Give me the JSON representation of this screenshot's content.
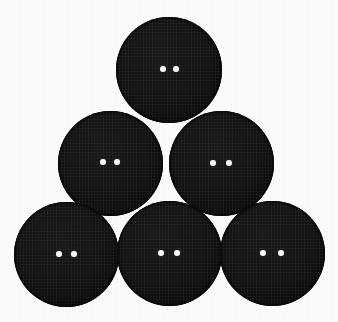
{
  "scene": {
    "title": "Six black two-hole sewing buttons arranged in a pyramid",
    "width": 338,
    "height": 322,
    "background_color": "#fdfdfd",
    "object_count": 6,
    "object_label": "button",
    "rows": 3,
    "row_counts": [
      1,
      2,
      3
    ]
  },
  "palette": {
    "background": "#fdfdfd",
    "button_body": "#0e0e0e",
    "button_highlight": "#171717",
    "button_shadow": "#070707",
    "hole_fill": "#fbfbfb"
  },
  "buttons": [
    {
      "id": "button-top-center",
      "row": 1,
      "position_in_row": 1,
      "cx": 169,
      "cy": 70,
      "diameter": 106,
      "color": "#0e0e0e",
      "hole_count": 2,
      "hole_diameter": 6,
      "hole_spacing": 13,
      "hole_offset_y": -1
    },
    {
      "id": "button-middle-left",
      "row": 2,
      "position_in_row": 1,
      "cx": 110,
      "cy": 163,
      "diameter": 105,
      "color": "#0e0e0e",
      "hole_count": 2,
      "hole_diameter": 6,
      "hole_spacing": 14,
      "hole_offset_y": -1
    },
    {
      "id": "button-middle-right",
      "row": 2,
      "position_in_row": 2,
      "cx": 221,
      "cy": 163,
      "diameter": 105,
      "color": "#0e0e0e",
      "hole_count": 2,
      "hole_diameter": 6,
      "hole_spacing": 16,
      "hole_offset_y": 0
    },
    {
      "id": "button-bottom-left",
      "row": 3,
      "position_in_row": 1,
      "cx": 66,
      "cy": 254,
      "diameter": 105,
      "color": "#0e0e0e",
      "hole_count": 2,
      "hole_diameter": 6,
      "hole_spacing": 15,
      "hole_offset_y": 0
    },
    {
      "id": "button-bottom-center",
      "row": 3,
      "position_in_row": 2,
      "cx": 169,
      "cy": 253,
      "diameter": 105,
      "color": "#0e0e0e",
      "hole_count": 2,
      "hole_diameter": 6,
      "hole_spacing": 16,
      "hole_offset_y": 0
    },
    {
      "id": "button-bottom-right",
      "row": 3,
      "position_in_row": 3,
      "cx": 272,
      "cy": 253,
      "diameter": 105,
      "color": "#0e0e0e",
      "hole_count": 2,
      "hole_diameter": 6,
      "hole_spacing": 18,
      "hole_offset_y": 0
    }
  ]
}
